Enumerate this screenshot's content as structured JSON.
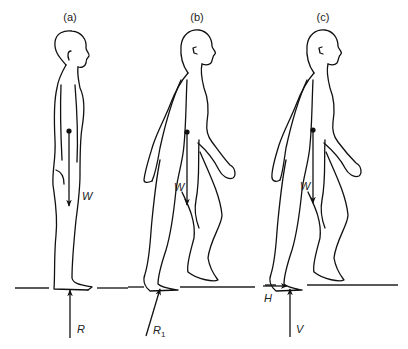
{
  "panels": [
    {
      "id": "a",
      "label": "(a)",
      "weight_label": "W",
      "reaction_label": "R",
      "reaction_sub": ""
    },
    {
      "id": "b",
      "label": "(b)",
      "weight_label": "W",
      "reaction_label": "R",
      "reaction_sub": "1"
    },
    {
      "id": "c",
      "label": "(c)",
      "weight_label": "W",
      "horizontal_label": "H",
      "vertical_label": "V"
    }
  ],
  "colors": {
    "line": "#111111",
    "background": "#ffffff"
  }
}
